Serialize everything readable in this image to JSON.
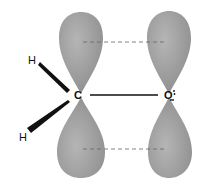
{
  "diagram": {
    "atoms": [
      {
        "id": "H1",
        "label": "H"
      },
      {
        "id": "H2",
        "label": "H"
      },
      {
        "id": "C",
        "label": "C"
      },
      {
        "id": "O",
        "label": "O"
      }
    ],
    "bonds": [
      {
        "from": "C",
        "to": "O",
        "style": "solid"
      },
      {
        "from": "C",
        "to": "H1",
        "style": "wedge"
      },
      {
        "from": "C",
        "to": "H2",
        "style": "wedge"
      }
    ],
    "orbitals": [
      {
        "atom": "C",
        "type": "p",
        "lobes": [
          "top",
          "bottom"
        ]
      },
      {
        "atom": "O",
        "type": "p",
        "lobes": [
          "top",
          "bottom"
        ]
      }
    ],
    "overlap_lines": [
      {
        "position": "top",
        "style": "dashed"
      },
      {
        "position": "bottom",
        "style": "dashed"
      }
    ],
    "lone_pair_dots": "O",
    "colors": {
      "lobe": "#9a9a9a",
      "lobe_highlight": "#b8b8b8",
      "line": "#111111",
      "dash": "#666666",
      "background": "#ffffff"
    }
  }
}
